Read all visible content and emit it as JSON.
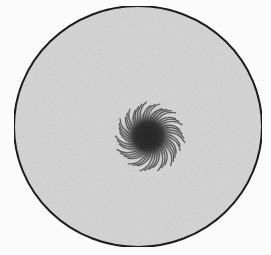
{
  "figure": {
    "kind": "illustration",
    "dish": {
      "cx": 138,
      "cy": 126.5,
      "rx": 124,
      "ry": 120.5,
      "fill": "#d9d9d9",
      "stroke": "#1c1c1c",
      "stroke_width": 2
    },
    "colony": {
      "cx": 150,
      "cy": 137,
      "outer_radius": 36,
      "core_radius": 20,
      "core_color": "#2a2a2a",
      "fringe_color": "#5a5a5a",
      "strand_count": 48
    },
    "background": "#fbfbfb"
  }
}
